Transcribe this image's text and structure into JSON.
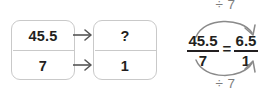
{
  "diagram": {
    "stroke_color": "#7d7d7d",
    "box_border_color": "#c9c9c9",
    "text_color": "#231f20",
    "ratio_boxes": [
      {
        "name": "source-ratio",
        "top_value": "45.5",
        "bottom_value": "7"
      },
      {
        "name": "target-ratio",
        "top_value": "?",
        "bottom_value": "1"
      }
    ],
    "arrows": {
      "top_row_arrow": "arrow-right",
      "bottom_row_arrow": "arrow-right"
    },
    "equation": {
      "left_fraction": {
        "numerator": "45.5",
        "denominator": "7"
      },
      "relation": "=",
      "right_fraction": {
        "numerator": "6.5",
        "denominator": "1"
      },
      "top_operation": "÷ 7",
      "bottom_operation": "÷ 7"
    }
  }
}
